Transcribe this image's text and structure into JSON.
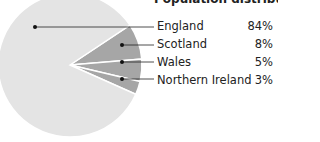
{
  "chart_data": {
    "type": "pie",
    "title": "Population distribution",
    "categories": [
      "England",
      "Scotland",
      "Wales",
      "Northern Ireland"
    ],
    "values": [
      84,
      8,
      5,
      3
    ],
    "labels": [
      "84%",
      "8%",
      "5%",
      "3%"
    ],
    "colors": [
      "#e4e4e4",
      "#a6a6a6",
      "#a6a6a6",
      "#a6a6a6"
    ],
    "legend_position": "right"
  },
  "legend": {
    "rows": [
      {
        "label": "England",
        "value": "84%"
      },
      {
        "label": "Scotland",
        "value": "8%"
      },
      {
        "label": "Wales",
        "value": "5%"
      },
      {
        "label": "Northern Ireland",
        "value": "3%"
      }
    ]
  }
}
